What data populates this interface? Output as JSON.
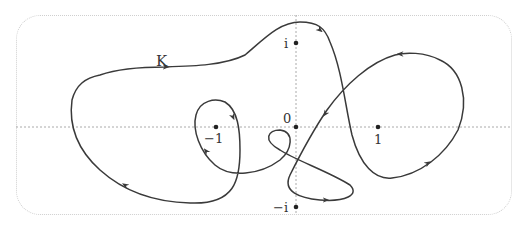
{
  "diagram": {
    "curve_label": "K",
    "axes": {
      "real_axis": "dotted horizontal",
      "imaginary_axis": "dotted vertical"
    },
    "points": [
      {
        "id": "minus-one",
        "label": "−1",
        "x": 212,
        "y": 127
      },
      {
        "id": "zero",
        "label": "0",
        "x": 296,
        "y": 127
      },
      {
        "id": "one",
        "label": "1",
        "x": 378,
        "y": 127
      },
      {
        "id": "i",
        "label": "i",
        "x": 296,
        "y": 43
      },
      {
        "id": "minus-i",
        "label": "−i",
        "x": 296,
        "y": 207
      }
    ],
    "colors": {
      "curve": "#3a3a3a",
      "axis": "#aaaaaa",
      "frame": "#cfcfcf",
      "text": "#333333"
    }
  }
}
